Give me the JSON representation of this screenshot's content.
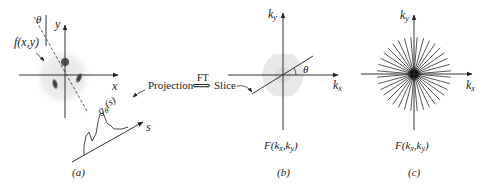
{
  "panels": [
    {
      "id": "a",
      "caption": "(a)",
      "function_label": "f(x,y)",
      "x_axis_label": "x",
      "y_axis_label": "y",
      "angle_label": "θ",
      "projection_label": "g",
      "projection_sub": "θ",
      "projection_arg": "(s)",
      "s_axis_label": "s"
    },
    {
      "id": "b",
      "caption": "(b)",
      "function_label": "F(",
      "kx_k": "k",
      "kx_sub": "x",
      "ky_k": "k",
      "ky_sub": "y",
      "comma": ",",
      "close": ")",
      "x_axis_label_k": "k",
      "x_axis_label_sub": "x",
      "y_axis_label_k": "k",
      "y_axis_label_sub": "y",
      "angle_label": "θ"
    },
    {
      "id": "c",
      "caption": "(c)",
      "function_label": "F(",
      "kx_k": "k",
      "kx_sub": "x",
      "ky_k": "k",
      "ky_sub": "y",
      "comma": ",",
      "close": ")",
      "x_axis_label_k": "k",
      "x_axis_label_sub": "x",
      "y_axis_label_k": "k",
      "y_axis_label_sub": "y",
      "num_radial_lines": 36
    }
  ],
  "connector": {
    "left_label": "Projection",
    "middle_label": "FT",
    "arrow_glyph": "⟺",
    "right_label": "Slice"
  },
  "colors": {
    "line": "#333333",
    "blob": "#e6e6e6",
    "dot": "#555555"
  }
}
